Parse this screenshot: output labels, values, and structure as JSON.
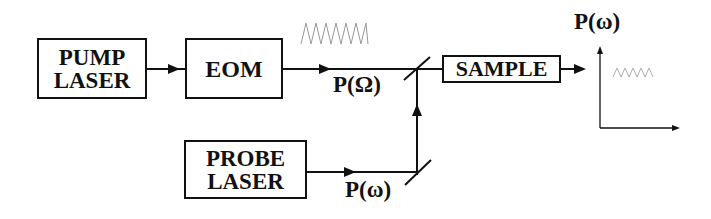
{
  "diagram": {
    "blocks": {
      "pump_laser": {
        "line1": "PUMP",
        "line2": "LASER"
      },
      "eom": {
        "label": "EOM"
      },
      "probe_laser": {
        "line1": "PROBE",
        "line2": "LASER"
      },
      "sample": {
        "label": "SAMPLE"
      }
    },
    "labels": {
      "pump_signal": "P(Ω)",
      "probe_signal": "P(ω)",
      "output_axis": "P(ω)"
    },
    "icons": {
      "modulation_wave": "sine-wave",
      "output_wave": "sine-wave",
      "beam_splitter": "mirror"
    },
    "colors": {
      "line": "#111111",
      "wave": "#999999",
      "output_wave": "#b0b0b0"
    }
  }
}
